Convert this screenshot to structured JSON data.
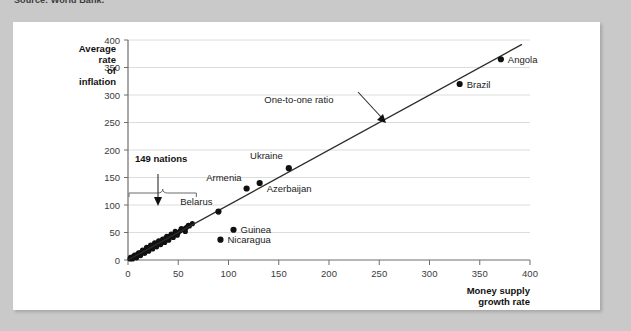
{
  "source_caption": "Source: World Bank.",
  "chart_data": {
    "type": "scatter",
    "title": "",
    "xlabel": "Money supply growth rate",
    "ylabel": "Average rate of inflation",
    "xlim": [
      0,
      400
    ],
    "ylim": [
      0,
      400
    ],
    "xticks": [
      0,
      50,
      100,
      150,
      200,
      250,
      300,
      350,
      400
    ],
    "yticks": [
      0,
      50,
      100,
      150,
      200,
      250,
      300,
      350,
      400
    ],
    "grid": "horizontal",
    "legend": "none",
    "reference_line": {
      "label": "One-to-one ratio",
      "slope": 1,
      "intercept": 0,
      "x_start": 0,
      "x_end": 392
    },
    "annotations": [
      {
        "text": "149 nations",
        "bold": true,
        "x": 33,
        "y": 178
      },
      {
        "text": "One-to-one ratio",
        "bold": false,
        "x": 170,
        "y": 285
      }
    ],
    "labeled_points": [
      {
        "name": "Belarus",
        "x": 90,
        "y": 88
      },
      {
        "name": "Armenia",
        "x": 118,
        "y": 130
      },
      {
        "name": "Azerbaijan",
        "x": 131,
        "y": 140
      },
      {
        "name": "Ukraine",
        "x": 160,
        "y": 167
      },
      {
        "name": "Guinea",
        "x": 105,
        "y": 55
      },
      {
        "name": "Nicaragua",
        "x": 92,
        "y": 37
      },
      {
        "name": "Brazil",
        "x": 330,
        "y": 320
      },
      {
        "name": "Angola",
        "x": 371,
        "y": 365
      }
    ],
    "cluster_points": [
      {
        "x": 2,
        "y": 2
      },
      {
        "x": 3,
        "y": 4
      },
      {
        "x": 4,
        "y": 3
      },
      {
        "x": 5,
        "y": 6
      },
      {
        "x": 6,
        "y": 5
      },
      {
        "x": 7,
        "y": 8
      },
      {
        "x": 8,
        "y": 7
      },
      {
        "x": 9,
        "y": 10
      },
      {
        "x": 10,
        "y": 9
      },
      {
        "x": 11,
        "y": 12
      },
      {
        "x": 12,
        "y": 11
      },
      {
        "x": 13,
        "y": 14
      },
      {
        "x": 14,
        "y": 13
      },
      {
        "x": 15,
        "y": 16
      },
      {
        "x": 16,
        "y": 15
      },
      {
        "x": 17,
        "y": 18
      },
      {
        "x": 18,
        "y": 17
      },
      {
        "x": 19,
        "y": 21
      },
      {
        "x": 20,
        "y": 19
      },
      {
        "x": 21,
        "y": 23
      },
      {
        "x": 22,
        "y": 22
      },
      {
        "x": 23,
        "y": 25
      },
      {
        "x": 24,
        "y": 24
      },
      {
        "x": 25,
        "y": 27
      },
      {
        "x": 26,
        "y": 26
      },
      {
        "x": 27,
        "y": 29
      },
      {
        "x": 28,
        "y": 28
      },
      {
        "x": 29,
        "y": 31
      },
      {
        "x": 30,
        "y": 30
      },
      {
        "x": 31,
        "y": 33
      },
      {
        "x": 32,
        "y": 32
      },
      {
        "x": 33,
        "y": 35
      },
      {
        "x": 34,
        "y": 34
      },
      {
        "x": 35,
        "y": 37
      },
      {
        "x": 36,
        "y": 36
      },
      {
        "x": 37,
        "y": 39
      },
      {
        "x": 38,
        "y": 38
      },
      {
        "x": 39,
        "y": 41
      },
      {
        "x": 40,
        "y": 40
      },
      {
        "x": 41,
        "y": 43
      },
      {
        "x": 42,
        "y": 42
      },
      {
        "x": 44,
        "y": 45
      },
      {
        "x": 46,
        "y": 46
      },
      {
        "x": 48,
        "y": 49
      },
      {
        "x": 50,
        "y": 50
      },
      {
        "x": 52,
        "y": 53
      },
      {
        "x": 55,
        "y": 56
      },
      {
        "x": 58,
        "y": 59
      },
      {
        "x": 61,
        "y": 62
      },
      {
        "x": 64,
        "y": 66
      },
      {
        "x": 2.5,
        "y": 5
      },
      {
        "x": 4.5,
        "y": 2
      },
      {
        "x": 6.5,
        "y": 9
      },
      {
        "x": 8.5,
        "y": 4
      },
      {
        "x": 10.5,
        "y": 13
      },
      {
        "x": 12.5,
        "y": 8
      },
      {
        "x": 14.5,
        "y": 18
      },
      {
        "x": 16.5,
        "y": 12
      },
      {
        "x": 18.5,
        "y": 23
      },
      {
        "x": 20.5,
        "y": 16
      },
      {
        "x": 22.5,
        "y": 27
      },
      {
        "x": 24.5,
        "y": 20
      },
      {
        "x": 26.5,
        "y": 31
      },
      {
        "x": 28.5,
        "y": 24
      },
      {
        "x": 30.5,
        "y": 35
      },
      {
        "x": 32.5,
        "y": 28
      },
      {
        "x": 34.5,
        "y": 38
      },
      {
        "x": 36.5,
        "y": 32
      },
      {
        "x": 38.5,
        "y": 43
      },
      {
        "x": 40.5,
        "y": 36
      },
      {
        "x": 43,
        "y": 47
      },
      {
        "x": 45,
        "y": 41
      },
      {
        "x": 47,
        "y": 52
      },
      {
        "x": 49,
        "y": 45
      },
      {
        "x": 53,
        "y": 57
      },
      {
        "x": 57,
        "y": 52
      },
      {
        "x": 60,
        "y": 63
      }
    ],
    "bracket": {
      "x_start": 1,
      "x_end": 68,
      "y": 100
    }
  }
}
